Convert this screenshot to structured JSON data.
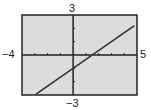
{
  "chart_data": {
    "type": "line",
    "title": "",
    "xlabel": "",
    "ylabel": "",
    "xlim": [
      -4,
      5
    ],
    "ylim": [
      -3,
      3
    ],
    "grid": false,
    "axes_tick_step": 1,
    "window_labels": {
      "xmin": "−4",
      "xmax": "5",
      "ymin": "−3",
      "ymax": "3"
    },
    "series": [
      {
        "name": "y = (2/3)x − 1",
        "x": [
          -2.9,
          4.8
        ],
        "y": [
          -2.93,
          2.2
        ]
      }
    ],
    "colors": {
      "background": "#dcdcdc",
      "line": "#333333",
      "axes": "#222222",
      "frame": "#222222"
    }
  }
}
